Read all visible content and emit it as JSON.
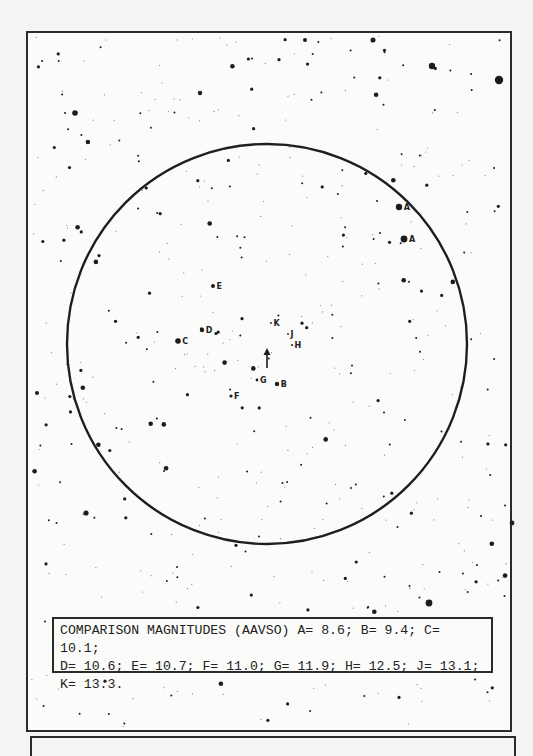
{
  "chart": {
    "frame": {
      "x": 27,
      "y": 32,
      "w": 484,
      "h": 699
    },
    "field_circle": {
      "cx": 267,
      "cy": 344,
      "rx": 200,
      "ry": 200
    },
    "variable_marker": {
      "x": 267,
      "y": 345,
      "label": "arrow-up"
    },
    "comparison_labels": [
      {
        "id": "A",
        "x": 399,
        "y": 207,
        "star_r": 3.2
      },
      {
        "id": "A",
        "x": 404,
        "y": 239,
        "star_r": 3.4
      },
      {
        "id": "B",
        "x": 277,
        "y": 384,
        "star_r": 2.2
      },
      {
        "id": "C",
        "x": 178,
        "y": 341,
        "star_r": 2.8
      },
      {
        "id": "D",
        "x": 202,
        "y": 330,
        "star_r": 2.2
      },
      {
        "id": "E",
        "x": 213,
        "y": 286,
        "star_r": 2.0
      },
      {
        "id": "F",
        "x": 231,
        "y": 396,
        "star_r": 1.6
      },
      {
        "id": "G",
        "x": 257,
        "y": 380,
        "star_r": 1.4
      },
      {
        "id": "H",
        "x": 292,
        "y": 345,
        "star_r": 1.0
      },
      {
        "id": "J",
        "x": 288,
        "y": 334,
        "star_r": 0.9
      },
      {
        "id": "K",
        "x": 271,
        "y": 323,
        "star_r": 0.9
      }
    ]
  },
  "chart_data": {
    "type": "table",
    "title": "COMPARISON MAGNITUDES (AAVSO)",
    "categories": [
      "A",
      "B",
      "C",
      "D",
      "E",
      "F",
      "G",
      "H",
      "J",
      "K"
    ],
    "values": [
      8.6,
      9.4,
      10.1,
      10.6,
      10.7,
      11.0,
      11.9,
      12.5,
      13.1,
      13.3
    ]
  },
  "caption": {
    "text": "COMPARISON MAGNITUDES (AAVSO) A= 8.6; B= 9.4; C= 10.1;\nD= 10.6; E= 10.7; F= 11.0; G= 11.9; H= 12.5; J= 13.1;\nK= 13.3."
  }
}
